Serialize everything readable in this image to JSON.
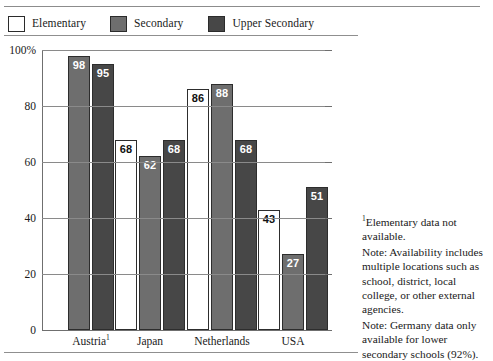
{
  "legend": {
    "items": [
      {
        "label": "Elementary",
        "key": "elementary",
        "swatch": "#ffffff",
        "icon": "legend-swatch-white"
      },
      {
        "label": "Secondary",
        "key": "secondary",
        "swatch": "#6e6e6e",
        "icon": "legend-swatch-grey"
      },
      {
        "label": "Upper Secondary",
        "key": "upper",
        "swatch": "#474747",
        "icon": "legend-swatch-dark"
      }
    ]
  },
  "axis": {
    "y_ticks": [
      "100%",
      "80",
      "60",
      "40",
      "20",
      "0"
    ],
    "y_tick_values": [
      100,
      80,
      60,
      40,
      20,
      0
    ]
  },
  "notes": {
    "footnote": "Elementary data not available.",
    "footnote_marker": "1",
    "note_1": "Note: Availability includes multiple locations such as school, district, local college, or other external agencies.",
    "note_2": "Note: Germany data only available for lower secondary schools (92%)."
  },
  "chart_data": {
    "type": "bar",
    "title": "",
    "xlabel": "",
    "ylabel": "",
    "ylim": [
      0,
      100
    ],
    "grid": true,
    "legend_position": "top",
    "categories": [
      "Austria",
      "Japan",
      "Netherlands",
      "USA"
    ],
    "category_labels": [
      {
        "text": "Austria",
        "superscript": "1"
      },
      {
        "text": "Japan",
        "superscript": ""
      },
      {
        "text": "Netherlands",
        "superscript": ""
      },
      {
        "text": "USA",
        "superscript": ""
      }
    ],
    "series": [
      {
        "name": "Elementary",
        "color": "#ffffff",
        "values": [
          null,
          68,
          86,
          43
        ]
      },
      {
        "name": "Secondary",
        "color": "#6e6e6e",
        "values": [
          98,
          62,
          88,
          27
        ]
      },
      {
        "name": "Upper Secondary",
        "color": "#474747",
        "values": [
          95,
          68,
          68,
          51
        ]
      }
    ]
  }
}
